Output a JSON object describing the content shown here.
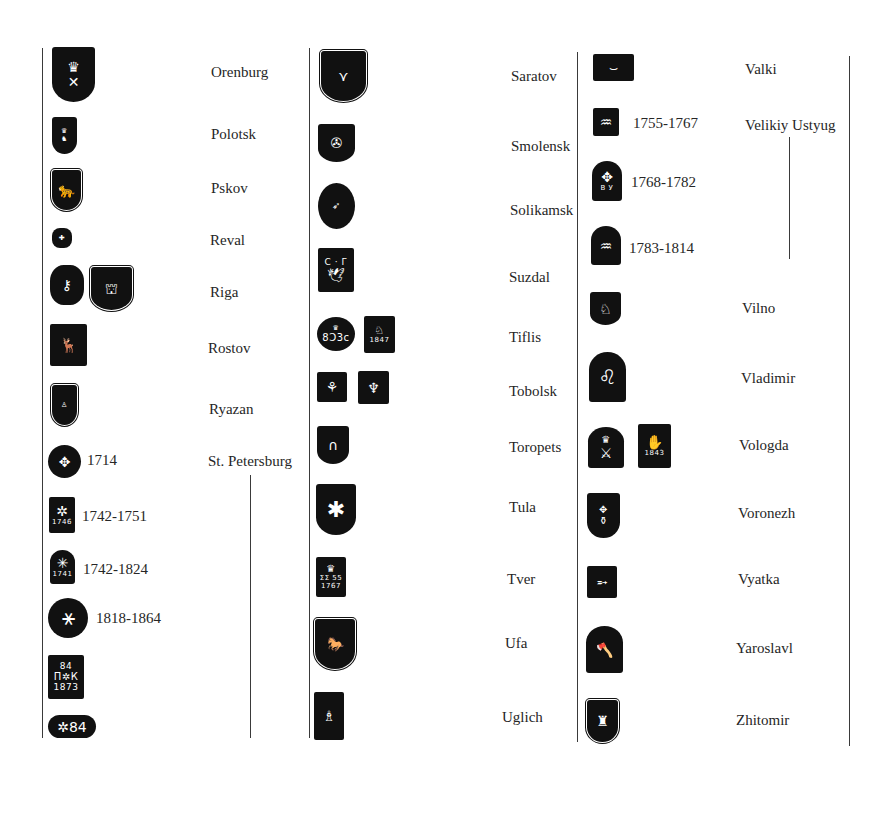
{
  "page": {
    "background": "#ffffff",
    "ink": "#111111"
  },
  "column1": {
    "entries": [
      {
        "city": "Orenburg",
        "dates": []
      },
      {
        "city": "Polotsk",
        "dates": []
      },
      {
        "city": "Pskov",
        "dates": []
      },
      {
        "city": "Reval",
        "dates": []
      },
      {
        "city": "Riga",
        "dates": []
      },
      {
        "city": "Rostov",
        "dates": []
      },
      {
        "city": "Ryazan",
        "dates": []
      },
      {
        "city": "St. Petersburg",
        "dates": [
          "1714",
          "1742-1751",
          "1742-1824",
          "1818-1864"
        ]
      }
    ],
    "mark_texts": {
      "stp_1742_1751": "1746",
      "stp_1742_1824": "1741",
      "stp_1873_top": "84",
      "stp_1873_mid": "П✲К",
      "stp_1873_bottom": "1873",
      "stp_oval": "✲84"
    }
  },
  "column2": {
    "entries": [
      {
        "city": "Saratov"
      },
      {
        "city": "Smolensk"
      },
      {
        "city": "Solikamsk"
      },
      {
        "city": "Suzdal"
      },
      {
        "city": "Tiflis"
      },
      {
        "city": "Tobolsk"
      },
      {
        "city": "Toropets"
      },
      {
        "city": "Tula"
      },
      {
        "city": "Tver"
      },
      {
        "city": "Ufa"
      },
      {
        "city": "Uglich"
      }
    ],
    "mark_texts": {
      "suzdal_letters": "С · Г",
      "tiflis_oval": "8Ͻ3c",
      "tiflis_rect": "1847",
      "tver_year": "1767",
      "tver_sub": "ΣΣ 55"
    }
  },
  "column3": {
    "entries": [
      {
        "city": "Valki",
        "dates": []
      },
      {
        "city": "Velikiy Ustyug",
        "dates": [
          "1755-1767",
          "1768-1782",
          "1783-1814"
        ]
      },
      {
        "city": "Vilno",
        "dates": []
      },
      {
        "city": "Vladimir",
        "dates": []
      },
      {
        "city": "Vologda",
        "dates": []
      },
      {
        "city": "Voronezh",
        "dates": []
      },
      {
        "city": "Vyatka",
        "dates": []
      },
      {
        "city": "Yaroslavl",
        "dates": []
      },
      {
        "city": "Zhitomir",
        "dates": []
      }
    ],
    "mark_texts": {
      "ustyug_letters": "В У",
      "vologda_year": "1843"
    }
  }
}
